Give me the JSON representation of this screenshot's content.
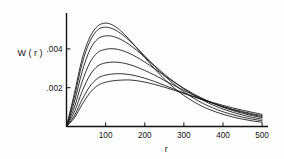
{
  "figure": {
    "background": "#fefefe",
    "ink": "#111111"
  },
  "chart_data": {
    "type": "line",
    "title": "",
    "xlabel": "r",
    "ylabel": "W ( r )",
    "xlim": [
      0,
      510
    ],
    "ylim": [
      0,
      0.0058
    ],
    "grid": false,
    "legend": "inline-curve-labels",
    "xticks": [
      100,
      200,
      300,
      400,
      500
    ],
    "xtick_labels": [
      "100",
      "200",
      "300",
      "400",
      "500"
    ],
    "yticks": [
      0.002,
      0.004
    ],
    "ytick_labels": [
      ".002",
      ".004"
    ],
    "x": [
      0,
      20,
      40,
      60,
      80,
      100,
      120,
      140,
      160,
      180,
      200,
      225,
      250,
      275,
      300,
      325,
      350,
      375,
      400,
      425,
      450,
      475,
      500
    ],
    "series": [
      {
        "name": "a",
        "label": "a",
        "peak_r": 95,
        "peak_w": 0.00533,
        "values": [
          0.0,
          0.00169,
          0.00349,
          0.00462,
          0.00518,
          0.00533,
          0.00521,
          0.00491,
          0.0045,
          0.00404,
          0.00356,
          0.00298,
          0.00245,
          0.00199,
          0.0016,
          0.00128,
          0.00101,
          0.0008,
          0.00063,
          0.00049,
          0.00038,
          0.00029,
          0.00022
        ]
      },
      {
        "name": "b",
        "label": "b",
        "peak_r": 102,
        "peak_w": 0.00512,
        "values": [
          0.0,
          0.0015,
          0.00325,
          0.0044,
          0.00499,
          0.00512,
          0.00502,
          0.00478,
          0.00444,
          0.00405,
          0.00363,
          0.00311,
          0.00262,
          0.00218,
          0.00179,
          0.00146,
          0.00118,
          0.00095,
          0.00076,
          0.00061,
          0.00048,
          0.00038,
          0.0003
        ]
      },
      {
        "name": "c",
        "label": "c",
        "peak_r": 112,
        "peak_w": 0.00467,
        "values": [
          0.0,
          0.00125,
          0.00283,
          0.00396,
          0.00452,
          0.00467,
          0.00464,
          0.00448,
          0.00423,
          0.00392,
          0.00358,
          0.00314,
          0.0027,
          0.0023,
          0.00194,
          0.00162,
          0.00134,
          0.0011,
          0.0009,
          0.00073,
          0.00059,
          0.00047,
          0.00038
        ]
      },
      {
        "name": "d",
        "label": "d",
        "peak_r": 122,
        "peak_w": 0.00401,
        "values": [
          0.0,
          0.00098,
          0.00231,
          0.0033,
          0.00382,
          0.00398,
          0.00401,
          0.00393,
          0.00378,
          0.00357,
          0.00332,
          0.00298,
          0.00263,
          0.00229,
          0.00197,
          0.00168,
          0.00142,
          0.00119,
          0.00099,
          0.00082,
          0.00068,
          0.00056,
          0.00046
        ]
      },
      {
        "name": "e",
        "label": "e",
        "peak_r": 132,
        "peak_w": 0.00332,
        "values": [
          0.0,
          0.00074,
          0.00181,
          0.00265,
          0.00312,
          0.00328,
          0.00332,
          0.00329,
          0.0032,
          0.00306,
          0.00289,
          0.00265,
          0.00238,
          0.00212,
          0.00186,
          0.00162,
          0.0014,
          0.0012,
          0.00102,
          0.00086,
          0.00073,
          0.00061,
          0.00051
        ]
      },
      {
        "name": "f",
        "label": "f",
        "peak_r": 142,
        "peak_w": 0.00272,
        "values": [
          0.0,
          0.00055,
          0.00139,
          0.00208,
          0.00249,
          0.00265,
          0.00271,
          0.00272,
          0.00268,
          0.0026,
          0.00249,
          0.00232,
          0.00213,
          0.00193,
          0.00173,
          0.00154,
          0.00136,
          0.00119,
          0.00103,
          0.00089,
          0.00077,
          0.00066,
          0.00056
        ]
      },
      {
        "name": "g",
        "label": "g",
        "peak_r": 152,
        "peak_w": 0.0024,
        "values": [
          0.0,
          0.00044,
          0.00114,
          0.00174,
          0.00212,
          0.00228,
          0.00236,
          0.00239,
          0.0024,
          0.00236,
          0.00229,
          0.00217,
          0.00203,
          0.00187,
          0.0017,
          0.00154,
          0.00138,
          0.00123,
          0.00109,
          0.00096,
          0.00084,
          0.00073,
          0.00063
        ]
      }
    ],
    "curve_label_positions": [
      {
        "name": "a",
        "r": 90,
        "w": 0.0057
      },
      {
        "name": "b",
        "r": 97,
        "w": 0.00537
      },
      {
        "name": "c",
        "r": 110,
        "w": 0.00495
      },
      {
        "name": "d",
        "r": 122,
        "w": 0.00428
      },
      {
        "name": "e",
        "r": 132,
        "w": 0.00358
      },
      {
        "name": "f",
        "r": 145,
        "w": 0.00296
      },
      {
        "name": "g",
        "r": 152,
        "w": 0.00224
      }
    ]
  }
}
